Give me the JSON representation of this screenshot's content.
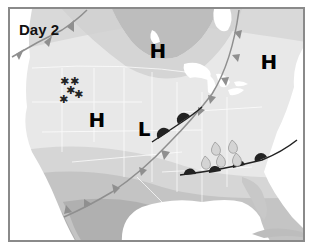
{
  "map": {
    "title": "Day 2",
    "pressure_systems": [
      {
        "type": "high",
        "label": "H",
        "x": 150,
        "y": 42
      },
      {
        "type": "high",
        "label": "H",
        "x": 261,
        "y": 53
      },
      {
        "type": "high",
        "label": "H",
        "x": 89,
        "y": 111
      },
      {
        "type": "low",
        "label": "L",
        "x": 138,
        "y": 120
      }
    ],
    "precipitation": {
      "snow_symbol": "✱",
      "snow_icon": "snowflake-icon",
      "rain_icon": "raindrop-icon"
    },
    "fronts": [
      {
        "type": "cold-front",
        "name": "main-cold-front"
      },
      {
        "type": "warm-front",
        "name": "central-warm-front"
      },
      {
        "type": "warm-front",
        "name": "southern-warm-front"
      },
      {
        "type": "cold-front",
        "name": "northwest-cold-front"
      }
    ],
    "colors": {
      "frame": "#8a8a8a",
      "land_light": "#e6e6e6",
      "band_mid": "#d2d2d2",
      "band_dark": "#bdbdbd",
      "band_darkest": "#a9a9a9",
      "water": "#ffffff",
      "front_cold": "#8f8f8f",
      "front_warm": "#222222",
      "text": "#111111"
    }
  }
}
